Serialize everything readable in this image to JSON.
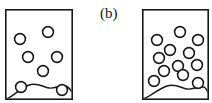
{
  "figure": {
    "width": 212,
    "height": 103,
    "background": "#ffffff",
    "stroke_color": "#1a1a1a",
    "circle_fill": "#ffffff",
    "label_text": "(b)",
    "label_x": 100,
    "label_y": 6
  },
  "panels": [
    {
      "name": "left-panel",
      "caption": "",
      "x": 5,
      "y": 9,
      "width": 68,
      "height": 91,
      "border_width": 1.6,
      "bubble_count": 6,
      "bubble_radius": 5.4,
      "bubbles": [
        {
          "cx": 15,
          "cy": 30
        },
        {
          "cx": 43,
          "cy": 23
        },
        {
          "cx": 23,
          "cy": 48
        },
        {
          "cx": 52,
          "cy": 48
        },
        {
          "cx": 38,
          "cy": 62
        },
        {
          "cx": 16,
          "cy": 78
        },
        {
          "cx": 57,
          "cy": 81
        }
      ],
      "mound_path": "M 1 90 C 8 88 14 80 24 76 C 32 73 38 78 44 79 C 50 80 54 76 60 77 C 63 77 65 80 67 83"
    },
    {
      "name": "right-panel",
      "caption": "",
      "x": 142,
      "y": 9,
      "width": 67,
      "height": 91,
      "border_width": 1.6,
      "bubble_count": 12,
      "bubble_radius": 5.4,
      "bubbles": [
        {
          "cx": 15,
          "cy": 31
        },
        {
          "cx": 38,
          "cy": 23
        },
        {
          "cx": 56,
          "cy": 31
        },
        {
          "cx": 28,
          "cy": 41
        },
        {
          "cx": 47,
          "cy": 44
        },
        {
          "cx": 17,
          "cy": 49
        },
        {
          "cx": 36,
          "cy": 57
        },
        {
          "cx": 55,
          "cy": 56
        },
        {
          "cx": 22,
          "cy": 62
        },
        {
          "cx": 41,
          "cy": 66
        },
        {
          "cx": 12,
          "cy": 72
        },
        {
          "cx": 56,
          "cy": 74
        }
      ],
      "mound_path": "M 1 90 C 8 88 14 81 25 77 C 33 74 39 79 45 80 C 51 81 55 77 61 78 C 63 78 65 81 66 84"
    }
  ],
  "accessibility": {
    "figure_description": "Two rectangular panels containing open circles above a wavy mound line; left panel shows sparse bubbles, right panel shows dense bubbles.",
    "left_panel_description": "Left rectangle with 6 circles",
    "right_panel_description": "Right rectangle with 12 circles"
  }
}
